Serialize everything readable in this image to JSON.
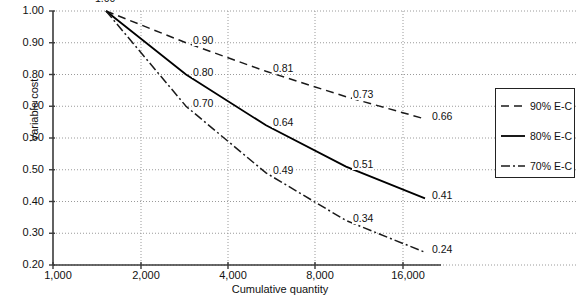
{
  "chart_data": {
    "type": "line",
    "title": "",
    "xlabel": "Cumulative quantity",
    "ylabel": "Variable cost",
    "xscale": "log2",
    "x": [
      1000,
      2000,
      4000,
      8000,
      16000
    ],
    "xticklabels": [
      "1,000",
      "2,000",
      "4,000",
      "8,000",
      "16,000"
    ],
    "xlim": [
      1000,
      16000
    ],
    "ylim": [
      0.2,
      1.0
    ],
    "yticklabels": [
      "1.00",
      "0.90",
      "0.80",
      "0.70",
      "0.60",
      "0.50",
      "0.40",
      "0.30",
      "0.20"
    ],
    "yticks": [
      1.0,
      0.9,
      0.8,
      0.7,
      0.6,
      0.5,
      0.4,
      0.3,
      0.2
    ],
    "grid": true,
    "legend_position": "right",
    "series": [
      {
        "name": "90% E-C",
        "style": "dashed",
        "color": "#1a1a1a",
        "values": [
          1.0,
          0.9,
          0.81,
          0.73,
          0.66
        ],
        "labels": [
          "1.00",
          "0.90",
          "0.81",
          "0.73",
          "0.66"
        ]
      },
      {
        "name": "80% E-C",
        "style": "solid",
        "color": "#000000",
        "values": [
          1.0,
          0.8,
          0.64,
          0.51,
          0.41
        ],
        "labels": [
          "1.00",
          "0.80",
          "0.64",
          "0.51",
          "0.41"
        ]
      },
      {
        "name": "70% E-C",
        "style": "dashdot",
        "color": "#1a1a1a",
        "values": [
          1.0,
          0.7,
          0.49,
          0.34,
          0.24
        ],
        "labels": [
          "1.00",
          "0.70",
          "0.49",
          "0.34",
          "0.24"
        ]
      }
    ]
  },
  "legend": {
    "items": [
      {
        "label": "90% E-C"
      },
      {
        "label": "80% E-C"
      },
      {
        "label": "70% E-C"
      }
    ]
  },
  "axes": {
    "x_title": "Cumulative quantity",
    "y_title": "Variable cost"
  }
}
